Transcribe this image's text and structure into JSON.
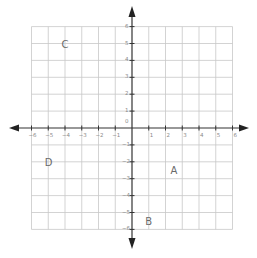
{
  "diagram": {
    "type": "coordinate-plane",
    "x_range": [
      -6,
      6
    ],
    "y_range": [
      -6,
      6
    ],
    "x_ticks": [
      "-6",
      "-5",
      "-4",
      "-3",
      "-2",
      "-1",
      "1",
      "2",
      "3",
      "4",
      "5",
      "6"
    ],
    "y_ticks": [
      "6",
      "5",
      "4",
      "3",
      "2",
      "1",
      "0",
      "-1",
      "-2",
      "-3",
      "-4",
      "-5",
      "-6"
    ],
    "points": [
      {
        "label": "A",
        "x": 2.5,
        "y": -2.5
      },
      {
        "label": "B",
        "x": 1,
        "y": -5.5
      },
      {
        "label": "C",
        "x": -4,
        "y": 5
      },
      {
        "label": "D",
        "x": -5,
        "y": -2
      }
    ],
    "colors": {
      "grid": "#c8c8c8",
      "axis": "#333333",
      "labels": "#6a6a6a"
    }
  }
}
